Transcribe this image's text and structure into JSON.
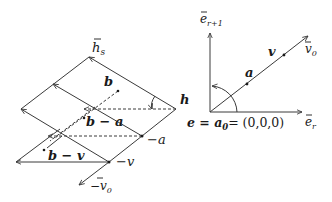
{
  "left_figure": {
    "labels": {
      "hs": "h",
      "hs_sub": "s",
      "b": "b",
      "b_minus_a": "b − a",
      "b_minus_v": "b − v",
      "h": "h",
      "minus_a": "−a",
      "minus_v": "−v",
      "minus_v0": "−v",
      "minus_v0_sub": "0"
    }
  },
  "right_figure": {
    "labels": {
      "e_r1": "e",
      "e_r1_sub": "r+1",
      "e_r": "e",
      "e_r_sub": "r",
      "v0": "v",
      "v0_sub": "0",
      "v": "v",
      "a": "a",
      "origin_eq_left": "e = a",
      "origin_eq_sub": "0",
      "origin_eq_right": "= (0,0,0)"
    }
  },
  "colors": {
    "line": "#3a3a3a",
    "text": "#1a1a1a"
  }
}
